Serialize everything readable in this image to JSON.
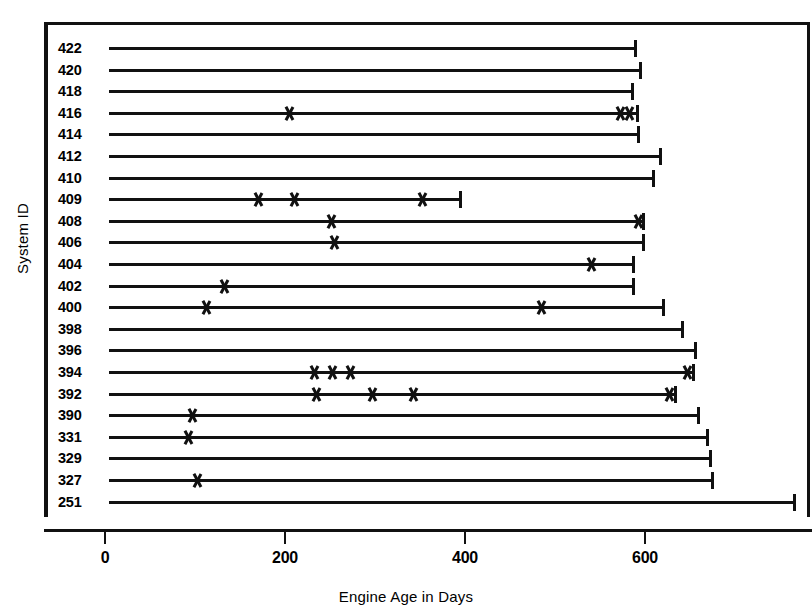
{
  "chart_data": {
    "type": "bar",
    "title": "",
    "subtitle": "",
    "xlabel": "Engine Age in Days",
    "ylabel": "System ID",
    "orientation": "horizontal",
    "grid": false,
    "legend": null,
    "xlim": [
      0,
      790
    ],
    "x_ticks": [
      0,
      200,
      400,
      600
    ],
    "x_tick_labels": [
      "0",
      "200",
      "400",
      "600"
    ],
    "marker_symbol": "x",
    "marker_meaning": "event",
    "categories": [
      "422",
      "420",
      "418",
      "416",
      "414",
      "412",
      "410",
      "409",
      "408",
      "406",
      "404",
      "402",
      "400",
      "398",
      "396",
      "394",
      "392",
      "390",
      "331",
      "329",
      "327",
      "251"
    ],
    "values": [
      583,
      589,
      580,
      586,
      587,
      611,
      603,
      389,
      592,
      592,
      581,
      581,
      614,
      636,
      650,
      648,
      628,
      653,
      663,
      667,
      669,
      760
    ],
    "rows": [
      {
        "id": "422",
        "length": 583,
        "markers": []
      },
      {
        "id": "420",
        "length": 589,
        "markers": []
      },
      {
        "id": "418",
        "length": 580,
        "markers": []
      },
      {
        "id": "416",
        "length": 586,
        "markers": [
          200,
          567,
          578
        ]
      },
      {
        "id": "414",
        "length": 587,
        "markers": []
      },
      {
        "id": "412",
        "length": 611,
        "markers": []
      },
      {
        "id": "410",
        "length": 603,
        "markers": []
      },
      {
        "id": "409",
        "length": 389,
        "markers": [
          165,
          205,
          348
        ]
      },
      {
        "id": "408",
        "length": 592,
        "markers": [
          246,
          587
        ]
      },
      {
        "id": "406",
        "length": 592,
        "markers": [
          250
        ]
      },
      {
        "id": "404",
        "length": 581,
        "markers": [
          535
        ]
      },
      {
        "id": "402",
        "length": 581,
        "markers": [
          127
        ]
      },
      {
        "id": "400",
        "length": 614,
        "markers": [
          108,
          480
        ]
      },
      {
        "id": "398",
        "length": 636,
        "markers": []
      },
      {
        "id": "396",
        "length": 650,
        "markers": []
      },
      {
        "id": "394",
        "length": 648,
        "markers": [
          227,
          248,
          267,
          642
        ]
      },
      {
        "id": "392",
        "length": 628,
        "markers": [
          230,
          292,
          338,
          622
        ]
      },
      {
        "id": "390",
        "length": 653,
        "markers": [
          92
        ]
      },
      {
        "id": "331",
        "length": 663,
        "markers": [
          87
        ]
      },
      {
        "id": "329",
        "length": 667,
        "markers": []
      },
      {
        "id": "327",
        "length": 669,
        "markers": [
          98
        ]
      },
      {
        "id": "251",
        "length": 760,
        "markers": []
      }
    ]
  },
  "axes": {
    "x_title": "Engine Age in Days",
    "y_title": "System ID"
  },
  "colors": {
    "ink": "#111111",
    "background": "#ffffff"
  }
}
